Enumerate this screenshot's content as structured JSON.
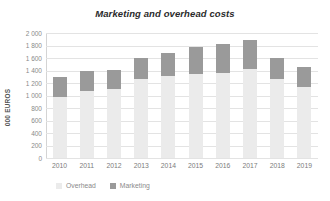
{
  "chart_data": {
    "type": "bar",
    "title": "Marketing and overhead costs",
    "subtitle": "",
    "xlabel": "",
    "ylabel": "000 EUROS",
    "ylim": [
      0,
      2000
    ],
    "ytick_step": 200,
    "grid": true,
    "stacked": true,
    "legend_position": "bottom-left",
    "categories": [
      "2010",
      "2011",
      "2012",
      "2013",
      "2014",
      "2015",
      "2016",
      "2017",
      "2018",
      "2019"
    ],
    "ytick_labels": [
      "0",
      "200",
      "400",
      "600",
      "800",
      "1 000",
      "1 200",
      "1 400",
      "1 600",
      "1 800",
      "2 000"
    ],
    "ytick_values": [
      0,
      200,
      400,
      600,
      800,
      1000,
      1200,
      1400,
      1600,
      1800,
      2000
    ],
    "series": [
      {
        "name": "Overhead",
        "color": "#ebebeb",
        "values": [
          975,
          1065,
          1100,
          1260,
          1310,
          1345,
          1360,
          1420,
          1260,
          1140
        ]
      },
      {
        "name": "Marketing",
        "color": "#9a9a9a",
        "values": [
          320,
          325,
          310,
          345,
          375,
          425,
          470,
          470,
          345,
          310
        ]
      }
    ],
    "totals": [
      1295,
      1390,
      1410,
      1605,
      1685,
      1770,
      1830,
      1890,
      1605,
      1450
    ]
  },
  "legend": {
    "items": [
      {
        "label": "Overhead",
        "color": "#ebebeb"
      },
      {
        "label": "Marketing",
        "color": "#9a9a9a"
      }
    ]
  }
}
